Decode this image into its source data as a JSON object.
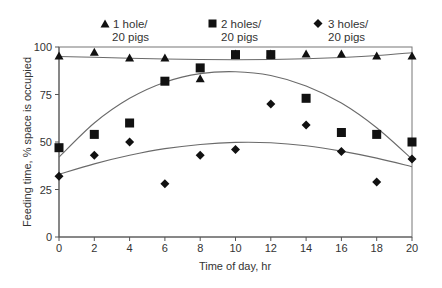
{
  "chart_data": {
    "type": "scatter",
    "title": "",
    "xlabel": "Time of day, hr",
    "ylabel": "Feeding time, % space is occupied",
    "xlim": [
      0,
      20
    ],
    "ylim": [
      0,
      100
    ],
    "x_ticks": [
      0,
      2,
      4,
      6,
      8,
      10,
      12,
      14,
      16,
      18,
      20
    ],
    "y_ticks": [
      0,
      25,
      50,
      75,
      100
    ],
    "grid": false,
    "legend_position": "top",
    "x": [
      0,
      2,
      4,
      6,
      8,
      10,
      12,
      14,
      16,
      18,
      20
    ],
    "series": [
      {
        "name": "1 hole/ 20 pigs",
        "label_line1": "1 hole/",
        "label_line2": "20 pigs",
        "marker": "triangle",
        "values": [
          95,
          97,
          94,
          94,
          83,
          96,
          96,
          96,
          96,
          95,
          95
        ],
        "trend": [
          [
            0,
            95
          ],
          [
            2,
            94.6
          ],
          [
            4,
            94.1
          ],
          [
            6,
            93.7
          ],
          [
            8,
            93.4
          ],
          [
            10,
            93.3
          ],
          [
            12,
            93.4
          ],
          [
            14,
            93.8
          ],
          [
            16,
            94.5
          ],
          [
            18,
            95.5
          ],
          [
            20,
            97
          ]
        ]
      },
      {
        "name": "2 holes/ 20 pigs",
        "label_line1": "2 holes/",
        "label_line2": "20 pigs",
        "marker": "square",
        "values": [
          47,
          54,
          60,
          82,
          89,
          96,
          96,
          73,
          55,
          54,
          50
        ],
        "trend": [
          [
            0,
            42
          ],
          [
            2,
            60
          ],
          [
            4,
            73
          ],
          [
            6,
            81.5
          ],
          [
            8,
            86
          ],
          [
            10,
            87
          ],
          [
            12,
            85
          ],
          [
            14,
            79.5
          ],
          [
            16,
            70.5
          ],
          [
            18,
            57.5
          ],
          [
            20,
            41
          ]
        ]
      },
      {
        "name": "3 holes/ 20 pigs",
        "label_line1": "3 holes/",
        "label_line2": "20 pigs",
        "marker": "diamond",
        "values": [
          32,
          43,
          50,
          28,
          43,
          46,
          70,
          59,
          45,
          29,
          41
        ],
        "trend": [
          [
            0,
            33
          ],
          [
            2,
            38.5
          ],
          [
            4,
            43
          ],
          [
            6,
            46.5
          ],
          [
            8,
            48.7
          ],
          [
            10,
            49.8
          ],
          [
            12,
            49.6
          ],
          [
            14,
            48
          ],
          [
            16,
            45.2
          ],
          [
            18,
            41.5
          ],
          [
            20,
            37
          ]
        ]
      }
    ]
  },
  "legend": {
    "items": [
      {
        "line1": "1 hole/",
        "line2": "20 pigs"
      },
      {
        "line1": "2 holes/",
        "line2": "20 pigs"
      },
      {
        "line1": "3 holes/",
        "line2": "20 pigs"
      }
    ]
  },
  "axes": {
    "xlabel": "Time of day, hr",
    "ylabel": "Feeding time, % space is occupied"
  },
  "colors": {
    "marker": "#111111",
    "curve": "#6a6a6a",
    "frame": "#777777"
  }
}
